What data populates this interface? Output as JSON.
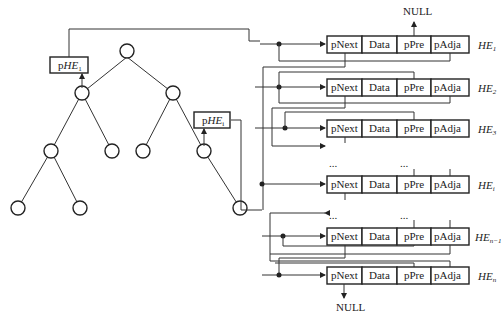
{
  "diagram": {
    "tree": {
      "nodes": 10,
      "pointer_boxes": [
        {
          "label_prefix": "p",
          "label_main": "HE",
          "subscript": "1"
        },
        {
          "label_prefix": "p",
          "label_main": "HE",
          "subscript": "i"
        }
      ]
    },
    "list": {
      "fields": [
        "pNext",
        "Data",
        "pPre",
        "pAdja"
      ],
      "rows": [
        {
          "label": "HE",
          "subscript": "1"
        },
        {
          "label": "HE",
          "subscript": "2"
        },
        {
          "label": "HE",
          "subscript": "3"
        },
        {
          "label": "HE",
          "subscript": "i"
        },
        {
          "label": "HE",
          "subscript": "n−1"
        },
        {
          "label": "HE",
          "subscript": "n"
        }
      ],
      "ellipsis": "...",
      "null_top": "NULL",
      "null_bottom": "NULL"
    }
  }
}
